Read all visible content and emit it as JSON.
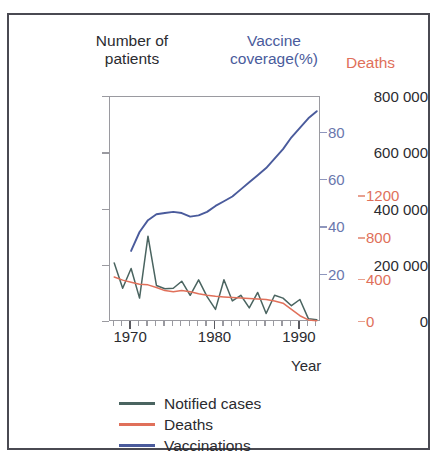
{
  "figure": {
    "headers": {
      "left": "Number of\npatients",
      "middle": "Vaccine\ncoverage(%)",
      "right": "Deaths"
    },
    "colors": {
      "notified_cases": "#4a6460",
      "deaths": "#e0705a",
      "vaccinations": "#4a5b9c",
      "left_axis_text": "#2b2b2f",
      "blue_axis_text": "#6a77ad",
      "red_axis_text": "#e0705a",
      "frame": "#4a4a52",
      "plot_border": "#9a9aa0"
    },
    "legend": {
      "items": [
        {
          "label": "Notified cases",
          "color": "#4a6460"
        },
        {
          "label": "Deaths",
          "color": "#e0705a"
        },
        {
          "label": "Vaccinations",
          "color": "#4a5b9c"
        }
      ]
    }
  },
  "chart_data": {
    "type": "line",
    "title": "",
    "xlabel": "Year",
    "grid": false,
    "legend_position": "bottom-left",
    "x": [
      1968,
      1969,
      1970,
      1971,
      1972,
      1973,
      1974,
      1975,
      1976,
      1977,
      1978,
      1979,
      1980,
      1981,
      1982,
      1983,
      1984,
      1985,
      1986,
      1987,
      1988,
      1989,
      1990,
      1991,
      1992
    ],
    "xlim": [
      1967.5,
      1992.5
    ],
    "xticks": [
      1970,
      1980,
      1990
    ],
    "xtick_labels": [
      "1970",
      "1980",
      "1990"
    ],
    "minor_xtick_step": 1,
    "axes": [
      {
        "id": "left",
        "name": "Number of patients",
        "side": "left",
        "color": "#2b2b2f",
        "lim": [
          0,
          800000
        ],
        "ticks": [
          0,
          200000,
          400000,
          600000,
          800000
        ],
        "tick_labels": [
          "0",
          "200 000",
          "400 000",
          "600 000",
          "800 000"
        ]
      },
      {
        "id": "blue",
        "name": "Vaccine coverage(%)",
        "side": "right",
        "color": "#6a77ad",
        "lim": [
          0,
          95
        ],
        "ticks": [
          20,
          40,
          60,
          80
        ],
        "tick_labels": [
          "20",
          "40",
          "60",
          "80"
        ]
      },
      {
        "id": "red",
        "name": "Deaths",
        "side": "right-outer",
        "color": "#e0705a",
        "lim": [
          0,
          2150
        ],
        "ticks": [
          0,
          400,
          800,
          1200
        ],
        "tick_labels": [
          "0",
          "400",
          "800",
          "1200"
        ]
      }
    ],
    "series": [
      {
        "name": "Notified cases",
        "axis": "left",
        "color": "#4a6460",
        "values": [
          210000,
          120000,
          190000,
          85000,
          305000,
          130000,
          118000,
          120000,
          145000,
          95000,
          150000,
          90000,
          45000,
          150000,
          75000,
          95000,
          50000,
          105000,
          30000,
          95000,
          85000,
          58000,
          80000,
          12000,
          8000
        ]
      },
      {
        "name": "Deaths",
        "axis": "red",
        "color": "#e0705a",
        "values": [
          430,
          400,
          380,
          360,
          355,
          330,
          300,
          290,
          300,
          290,
          270,
          255,
          245,
          240,
          235,
          230,
          225,
          220,
          215,
          200,
          180,
          120,
          60,
          20,
          12
        ]
      },
      {
        "name": "Vaccinations",
        "axis": "blue",
        "color": "#4a5b9c",
        "values": [
          null,
          null,
          30,
          38,
          43,
          45.5,
          46,
          46.5,
          46,
          44.5,
          45,
          46.5,
          49,
          51,
          53,
          56,
          59,
          62,
          65,
          69,
          73,
          78,
          82,
          86,
          89
        ]
      }
    ]
  }
}
